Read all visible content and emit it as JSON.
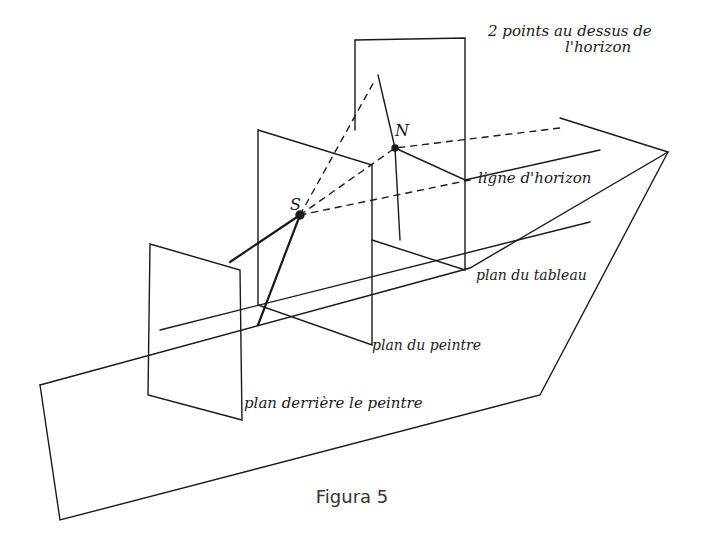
{
  "figure": {
    "caption": "Figura 5",
    "labels": {
      "points_above": "2 points au dessus de",
      "points_above_2": "l'horizon",
      "horizon_line": "ligne d'horizon",
      "picture_plane": "plan du tableau",
      "painter_plane": "plan du peintre",
      "behind_painter_plane": "plan derrière le peintre",
      "point_s": "S",
      "point_n": "N"
    }
  }
}
